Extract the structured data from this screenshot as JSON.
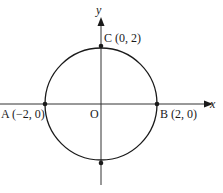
{
  "diagram": {
    "type": "circle-on-axes",
    "axes": {
      "x_label": "x",
      "y_label": "y",
      "origin_label": "O"
    },
    "circle": {
      "center": [
        0,
        0
      ],
      "radius": 2
    },
    "points": [
      {
        "id": "A",
        "label": "A (−2, 0)",
        "coords": [
          -2,
          0
        ]
      },
      {
        "id": "B",
        "label": "B (2, 0)",
        "coords": [
          2,
          0
        ]
      },
      {
        "id": "C",
        "label": "C (0, 2)",
        "coords": [
          0,
          2
        ]
      },
      {
        "id": "D",
        "label": "",
        "coords": [
          0,
          -2
        ]
      }
    ],
    "colors": {
      "stroke": "#1a1a1a",
      "axis": "#333333",
      "background": "#ffffff"
    }
  }
}
